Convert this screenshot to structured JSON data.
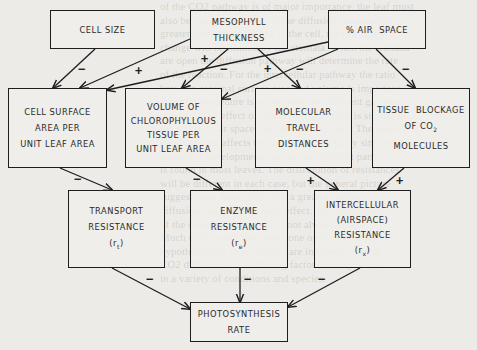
{
  "diagram": {
    "nodes": {
      "cell_size": {
        "lines": [
          "CELL SIZE"
        ]
      },
      "mesophyll": {
        "lines": [
          "MESOPHYLL",
          "THICKNESS"
        ]
      },
      "air_space": {
        "lines": [
          "% AIR  SPACE"
        ]
      },
      "cell_surface": {
        "lines": [
          "CELL SURFACE",
          "AREA PER",
          "UNIT LEAF AREA"
        ]
      },
      "chlorophyllous": {
        "lines": [
          "VOLUME OF",
          "CHLOROPHYLLOUS",
          "TISSUE PER",
          "UNIT LEAF AREA"
        ]
      },
      "molecular_travel": {
        "lines": [
          "MOLECULAR",
          "TRAVEL",
          "DISTANCES"
        ]
      },
      "tissue_blockage": {
        "lines": [
          "TISSUE  BLOCKAGE",
          "OF CO",
          "MOLECULES"
        ],
        "subscript": "2"
      },
      "transport": {
        "lines": [
          "TRANSPORT",
          "RESISTANCE",
          "(r"
        ],
        "symbol_sub": "t",
        "close": ")"
      },
      "enzyme": {
        "lines": [
          "ENZYME",
          "RESISTANCE",
          "(r"
        ],
        "symbol_sub": "e",
        "close": ")"
      },
      "intercellular": {
        "lines": [
          "INTERCELLULAR",
          "(AIRSPACE)",
          "RESISTANCE",
          "(r"
        ],
        "symbol_sub": "x",
        "close": ")"
      },
      "photosynthesis": {
        "lines": [
          "PHOTOSYNTHESIS",
          "RATE"
        ]
      }
    },
    "edges": [
      {
        "from": "cell_size",
        "to": "cell_surface",
        "sign": "−"
      },
      {
        "from": "mesophyll",
        "to": "cell_surface",
        "sign": "+"
      },
      {
        "from": "mesophyll",
        "to": "chlorophyllous",
        "sign": "+"
      },
      {
        "from": "mesophyll",
        "to": "molecular_travel",
        "sign": "+"
      },
      {
        "from": "air_space",
        "to": "cell_surface",
        "sign": "−"
      },
      {
        "from": "air_space",
        "to": "chlorophyllous",
        "sign": "−"
      },
      {
        "from": "air_space",
        "to": "tissue_blockage",
        "sign": "−"
      },
      {
        "from": "cell_surface",
        "to": "transport",
        "sign": "−"
      },
      {
        "from": "chlorophyllous",
        "to": "enzyme",
        "sign": "−"
      },
      {
        "from": "molecular_travel",
        "to": "intercellular",
        "sign": "+"
      },
      {
        "from": "tissue_blockage",
        "to": "intercellular",
        "sign": "+"
      },
      {
        "from": "transport",
        "to": "photosynthesis",
        "sign": "−"
      },
      {
        "from": "enzyme",
        "to": "photosynthesis",
        "sign": "−"
      },
      {
        "from": "intercellular",
        "to": "photosynthesis",
        "sign": "−"
      }
    ],
    "signs": {
      "plus": "+",
      "minus": "−"
    }
  }
}
